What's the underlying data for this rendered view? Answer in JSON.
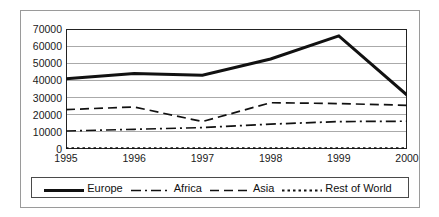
{
  "chart_data": {
    "type": "line",
    "title": "",
    "xlabel": "",
    "ylabel": "",
    "categories": [
      "1995",
      "1996",
      "1997",
      "1998",
      "1999",
      "2000"
    ],
    "ylim": [
      0,
      70000
    ],
    "ytick_labels": [
      "0",
      "10000",
      "20000",
      "30000",
      "40000",
      "50000",
      "60000",
      "70000"
    ],
    "ytick_values": [
      0,
      10000,
      20000,
      30000,
      40000,
      50000,
      60000,
      70000
    ],
    "grid": "horizontal",
    "legend_position": "bottom",
    "series": [
      {
        "name": "Europe",
        "style": "solid-thick",
        "color": "#111111",
        "values": [
          41000,
          44000,
          43000,
          52500,
          66000,
          31500
        ]
      },
      {
        "name": "Africa",
        "style": "dash-dot",
        "color": "#111111",
        "values": [
          10500,
          11500,
          12500,
          14500,
          16000,
          16200
        ]
      },
      {
        "name": "Asia",
        "style": "dashed",
        "color": "#111111",
        "values": [
          23000,
          24500,
          16000,
          27000,
          26500,
          25500
        ]
      },
      {
        "name": "Rest of World",
        "style": "dotted",
        "color": "#111111",
        "values": [
          500,
          500,
          500,
          500,
          500,
          500
        ]
      }
    ]
  },
  "legend": {
    "items": [
      {
        "label": "Europe"
      },
      {
        "label": "Africa"
      },
      {
        "label": "Asia"
      },
      {
        "label": "Rest of World"
      }
    ]
  },
  "colors": {
    "axis": "#222222",
    "gridline": "#aaaaaa",
    "outer_frame": "#9a9a9a",
    "text": "#1a1a1a"
  }
}
